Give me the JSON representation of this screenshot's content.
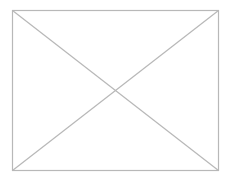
{
  "placeholder": {
    "kind": "image-placeholder",
    "icon": "crossed-box-icon",
    "stroke_color": "#b8b8b8",
    "background_color": "#ffffff",
    "box": {
      "x": 12,
      "y": 10,
      "width": 206,
      "height": 160
    }
  }
}
